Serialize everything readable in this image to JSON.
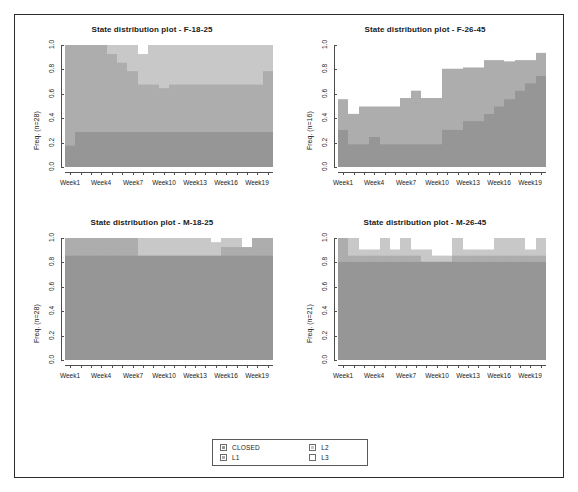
{
  "figure": {
    "background": "#ffffff",
    "frame_color": "#2b2b2b"
  },
  "legend": {
    "items": [
      {
        "label": "CLOSED",
        "color": "#969696"
      },
      {
        "label": "L2",
        "color": "#c8c8c8"
      },
      {
        "label": "L1",
        "color": "#adadad"
      },
      {
        "label": "L3",
        "color": "#ffffff"
      }
    ]
  },
  "chart_data": [
    {
      "type": "area",
      "id": "F-18-25",
      "title": "State distribution plot -  F-18-25",
      "ylabel": "Freq. (n=28)",
      "xlabel": "",
      "ylim": [
        0,
        1
      ],
      "ytick_labels": [
        "0.0",
        "0.2",
        "0.4",
        "0.6",
        "0.8",
        "1.0"
      ],
      "ytick_values": [
        0.0,
        0.2,
        0.4,
        0.6,
        0.8,
        1.0
      ],
      "x": [
        "Week1",
        "Week2",
        "Week3",
        "Week4",
        "Week5",
        "Week6",
        "Week7",
        "Week8",
        "Week9",
        "Week10",
        "Week11",
        "Week12",
        "Week13",
        "Week14",
        "Week15",
        "Week16",
        "Week17",
        "Week18",
        "Week19",
        "Week20"
      ],
      "xtick_labels": [
        "Week1",
        "Week4",
        "Week7",
        "Week10",
        "Week13",
        "Week16",
        "Week19"
      ],
      "xtick_at": [
        0,
        3,
        6,
        9,
        12,
        15,
        18
      ],
      "grid": false,
      "legend_position": "bottom-center-shared",
      "series": [
        {
          "name": "CLOSED",
          "color": "#969696",
          "values": [
            0.18,
            0.29,
            0.29,
            0.29,
            0.29,
            0.29,
            0.29,
            0.29,
            0.29,
            0.29,
            0.29,
            0.29,
            0.29,
            0.29,
            0.29,
            0.29,
            0.29,
            0.29,
            0.29,
            0.29
          ]
        },
        {
          "name": "L1",
          "color": "#adadad",
          "values": [
            0.82,
            0.71,
            0.71,
            0.71,
            0.64,
            0.57,
            0.5,
            0.39,
            0.39,
            0.36,
            0.39,
            0.39,
            0.39,
            0.39,
            0.39,
            0.39,
            0.39,
            0.39,
            0.39,
            0.5
          ]
        },
        {
          "name": "L2",
          "color": "#c8c8c8",
          "values": [
            0.0,
            0.0,
            0.0,
            0.0,
            0.07,
            0.14,
            0.21,
            0.25,
            0.32,
            0.36,
            0.32,
            0.32,
            0.32,
            0.32,
            0.32,
            0.32,
            0.32,
            0.32,
            0.32,
            0.21
          ]
        },
        {
          "name": "L3",
          "color": "#ffffff",
          "values": [
            0.0,
            0.0,
            0.0,
            0.0,
            0.0,
            0.0,
            0.0,
            0.07,
            0.0,
            0.0,
            0.0,
            0.0,
            0.0,
            0.0,
            0.0,
            0.0,
            0.0,
            0.0,
            0.0,
            0.0
          ]
        }
      ]
    },
    {
      "type": "area",
      "id": "F-26-45",
      "title": "State distribution plot -  F-26-45",
      "ylabel": "Freq. (n=16)",
      "xlabel": "",
      "ylim": [
        0,
        1
      ],
      "ytick_labels": [
        "0.0",
        "0.2",
        "0.4",
        "0.6",
        "0.8",
        "1.0"
      ],
      "ytick_values": [
        0.0,
        0.2,
        0.4,
        0.6,
        0.8,
        1.0
      ],
      "x": [
        "Week1",
        "Week2",
        "Week3",
        "Week4",
        "Week5",
        "Week6",
        "Week7",
        "Week8",
        "Week9",
        "Week10",
        "Week11",
        "Week12",
        "Week13",
        "Week14",
        "Week15",
        "Week16",
        "Week17",
        "Week18",
        "Week19",
        "Week20"
      ],
      "xtick_labels": [
        "Week1",
        "Week4",
        "Week7",
        "Week10",
        "Week13",
        "Week16",
        "Week19"
      ],
      "xtick_at": [
        0,
        3,
        6,
        9,
        12,
        15,
        18
      ],
      "grid": false,
      "legend_position": "bottom-center-shared",
      "series": [
        {
          "name": "CLOSED",
          "color": "#969696",
          "values": [
            0.31,
            0.19,
            0.19,
            0.25,
            0.19,
            0.19,
            0.19,
            0.19,
            0.19,
            0.19,
            0.31,
            0.31,
            0.38,
            0.38,
            0.44,
            0.5,
            0.56,
            0.63,
            0.69,
            0.75
          ]
        },
        {
          "name": "L1",
          "color": "#adadad",
          "values": [
            0.25,
            0.25,
            0.31,
            0.25,
            0.31,
            0.31,
            0.38,
            0.44,
            0.38,
            0.38,
            0.5,
            0.5,
            0.44,
            0.44,
            0.44,
            0.38,
            0.31,
            0.25,
            0.19,
            0.19
          ]
        },
        {
          "name": "L3",
          "color": "#ffffff",
          "values": [
            0.44,
            0.56,
            0.5,
            0.5,
            0.5,
            0.5,
            0.43,
            0.37,
            0.43,
            0.43,
            0.19,
            0.19,
            0.18,
            0.18,
            0.12,
            0.12,
            0.13,
            0.12,
            0.12,
            0.06
          ]
        }
      ]
    },
    {
      "type": "area",
      "id": "M-18-25",
      "title": "State distribution plot -  M-18-25",
      "ylabel": "Freq. (n=28)",
      "xlabel": "",
      "ylim": [
        0,
        1
      ],
      "ytick_labels": [
        "0.0",
        "0.2",
        "0.4",
        "0.6",
        "0.8",
        "1.0"
      ],
      "ytick_values": [
        0.0,
        0.2,
        0.4,
        0.6,
        0.8,
        1.0
      ],
      "x": [
        "Week1",
        "Week2",
        "Week3",
        "Week4",
        "Week5",
        "Week6",
        "Week7",
        "Week8",
        "Week9",
        "Week10",
        "Week11",
        "Week12",
        "Week13",
        "Week14",
        "Week15",
        "Week16",
        "Week17",
        "Week18",
        "Week19",
        "Week20"
      ],
      "xtick_labels": [
        "Week1",
        "Week4",
        "Week7",
        "Week10",
        "Week13",
        "Week16",
        "Week19"
      ],
      "xtick_at": [
        0,
        3,
        6,
        9,
        12,
        15,
        18
      ],
      "grid": false,
      "legend_position": "bottom-center-shared",
      "series": [
        {
          "name": "CLOSED",
          "color": "#969696",
          "values": [
            0.86,
            0.86,
            0.86,
            0.86,
            0.86,
            0.86,
            0.86,
            0.86,
            0.86,
            0.86,
            0.86,
            0.86,
            0.86,
            0.86,
            0.86,
            0.86,
            0.86,
            0.86,
            0.86,
            0.86
          ]
        },
        {
          "name": "L1",
          "color": "#adadad",
          "values": [
            0.14,
            0.14,
            0.14,
            0.14,
            0.14,
            0.14,
            0.14,
            0.0,
            0.0,
            0.0,
            0.0,
            0.0,
            0.0,
            0.0,
            0.0,
            0.07,
            0.07,
            0.07,
            0.14,
            0.14
          ]
        },
        {
          "name": "L2",
          "color": "#c8c8c8",
          "values": [
            0.0,
            0.0,
            0.0,
            0.0,
            0.0,
            0.0,
            0.0,
            0.14,
            0.14,
            0.14,
            0.14,
            0.14,
            0.14,
            0.14,
            0.11,
            0.07,
            0.07,
            0.0,
            0.0,
            0.0
          ]
        },
        {
          "name": "L3",
          "color": "#ffffff",
          "values": [
            0.0,
            0.0,
            0.0,
            0.0,
            0.0,
            0.0,
            0.0,
            0.0,
            0.0,
            0.0,
            0.0,
            0.0,
            0.0,
            0.0,
            0.03,
            0.0,
            0.0,
            0.07,
            0.0,
            0.0
          ]
        }
      ]
    },
    {
      "type": "area",
      "id": "M-26-45",
      "title": "State distribution plot -  M-26-45",
      "ylabel": "Freq. (n=21)",
      "xlabel": "",
      "ylim": [
        0,
        1
      ],
      "ytick_labels": [
        "0.0",
        "0.2",
        "0.4",
        "0.6",
        "0.8",
        "1.0"
      ],
      "ytick_values": [
        0.0,
        0.2,
        0.4,
        0.6,
        0.8,
        1.0
      ],
      "x": [
        "Week1",
        "Week2",
        "Week3",
        "Week4",
        "Week5",
        "Week6",
        "Week7",
        "Week8",
        "Week9",
        "Week10",
        "Week11",
        "Week12",
        "Week13",
        "Week14",
        "Week15",
        "Week16",
        "Week17",
        "Week18",
        "Week19",
        "Week20"
      ],
      "xtick_labels": [
        "Week1",
        "Week4",
        "Week7",
        "Week10",
        "Week13",
        "Week16",
        "Week19"
      ],
      "xtick_at": [
        0,
        3,
        6,
        9,
        12,
        15,
        18
      ],
      "grid": false,
      "legend_position": "bottom-center-shared",
      "series": [
        {
          "name": "CLOSED",
          "color": "#969696",
          "values": [
            0.81,
            0.81,
            0.81,
            0.81,
            0.81,
            0.81,
            0.81,
            0.81,
            0.81,
            0.81,
            0.81,
            0.81,
            0.81,
            0.81,
            0.81,
            0.81,
            0.81,
            0.81,
            0.81,
            0.81
          ]
        },
        {
          "name": "L1",
          "color": "#adadad",
          "values": [
            0.19,
            0.05,
            0.05,
            0.05,
            0.05,
            0.05,
            0.05,
            0.05,
            0.0,
            0.0,
            0.0,
            0.05,
            0.05,
            0.05,
            0.05,
            0.05,
            0.05,
            0.05,
            0.05,
            0.05
          ]
        },
        {
          "name": "L2",
          "color": "#c8c8c8",
          "values": [
            0.0,
            0.14,
            0.05,
            0.05,
            0.14,
            0.05,
            0.14,
            0.05,
            0.1,
            0.05,
            0.05,
            0.14,
            0.05,
            0.05,
            0.05,
            0.14,
            0.14,
            0.14,
            0.05,
            0.14
          ]
        },
        {
          "name": "L3",
          "color": "#ffffff",
          "values": [
            0.0,
            0.0,
            0.09,
            0.09,
            0.0,
            0.09,
            0.0,
            0.09,
            0.09,
            0.14,
            0.14,
            0.0,
            0.09,
            0.09,
            0.09,
            0.0,
            0.0,
            0.0,
            0.09,
            0.0
          ]
        }
      ]
    }
  ]
}
